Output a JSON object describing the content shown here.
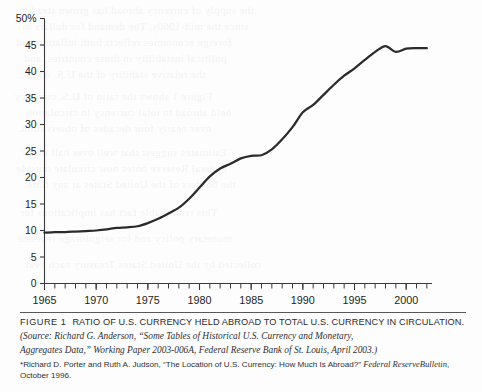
{
  "chart_data": {
    "type": "line",
    "title": "",
    "xlabel": "",
    "ylabel": "",
    "xlim": [
      1965,
      2002.5
    ],
    "ylim": [
      0,
      50
    ],
    "grid": false,
    "legend": "none",
    "y_tick_labels": [
      "50%",
      "45",
      "40",
      "35",
      "30",
      "25",
      "20",
      "15",
      "10",
      "5",
      "0"
    ],
    "y_tick_values": [
      50,
      45,
      40,
      35,
      30,
      25,
      20,
      15,
      10,
      5,
      0
    ],
    "x_tick_labels": [
      "1965",
      "1970",
      "1975",
      "1980",
      "1985",
      "1990",
      "1995",
      "2000"
    ],
    "x_tick_values": [
      1965,
      1970,
      1975,
      1980,
      1985,
      1990,
      1995,
      2000
    ],
    "x_minor_tick_interval": 1,
    "series": [
      {
        "name": "Ratio of U.S. currency held abroad to total U.S. currency in circulation",
        "color": "#2b2b2b",
        "x": [
          1965,
          1966,
          1967,
          1968,
          1969,
          1970,
          1971,
          1972,
          1973,
          1974,
          1975,
          1976,
          1977,
          1978,
          1979,
          1980,
          1981,
          1982,
          1983,
          1984,
          1985,
          1986,
          1987,
          1988,
          1989,
          1990,
          1991,
          1992,
          1993,
          1994,
          1995,
          1996,
          1997,
          1998,
          1999,
          2000,
          2001,
          2002
        ],
        "values": [
          9.6,
          9.7,
          9.7,
          9.8,
          9.9,
          10.0,
          10.2,
          10.5,
          10.6,
          10.8,
          11.4,
          12.2,
          13.2,
          14.3,
          16.0,
          18.1,
          20.2,
          21.7,
          22.6,
          23.6,
          24.1,
          24.2,
          25.3,
          27.2,
          29.5,
          32.3,
          33.7,
          35.6,
          37.5,
          39.2,
          40.6,
          42.2,
          43.7,
          44.8,
          43.7,
          44.3,
          44.4,
          44.4
        ]
      }
    ]
  },
  "axis": {
    "y_axis_name": "percent-axis",
    "x_axis_name": "year-axis"
  },
  "caption": {
    "figure_label": "FIGURE 1",
    "figure_title": "RATIO OF U.S. CURRENCY HELD ABROAD TO TOTAL U.S. CURRENCY IN CIRCULATION.",
    "source_line_1": "(Source: Richard G. Anderson, “Some Tables of Historical U.S. Currency and Monetary,",
    "source_line_2": "Aggregates Data,” Working Paper 2003-006A, Federal Reserve Bank of St. Louis, April 2003.)",
    "footnote_part_1": "*Richard D. Porter and Ruth A. Judson, “The Location of U.S. Currency: How Much Is Abroad?” ",
    "footnote_italic_1": "Federal Reserve",
    "footnote_italic_2": "Bulletin",
    "footnote_part_2": ", October 1996."
  },
  "ghost_text": {
    "lines": [
      "the supply of currency abroad has grown steadily",
      "since the mid-1960s. The demand for dollars in",
      "foreign economies reflects both inflation and",
      "political instability in those countries, and",
      "the relative stability of the U.S. dollar.",
      "Figure 1 shows the ratio of U.S. currency",
      "held abroad to total currency in circulation",
      "over nearly four decades of observation.",
      "Estimates suggest that well over half of all",
      "Federal Reserve notes now circulate outside",
      "the borders of the United States at any time.",
      "This remarkable fact has implications for",
      "monetary policy and for seigniorage revenue",
      "collected by the United States Treasury each year."
    ]
  },
  "colors": {
    "line": "#2b2b2b",
    "axis": "#3a3a3a",
    "text": "#231f20",
    "rule": "#58585b",
    "page": "#fdfdfd"
  }
}
